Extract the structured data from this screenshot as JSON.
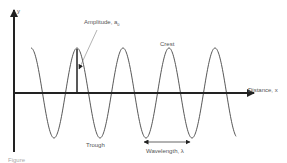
{
  "diagram": {
    "axes": {
      "y_label": "y",
      "x_label": "Distance, x"
    },
    "labels": {
      "amplitude": "Amplitude, a",
      "amplitude_subscript": "0",
      "crest": "Crest",
      "trough": "Trough",
      "wavelength": "Wavelength, λ"
    },
    "caption": "Figure",
    "colors": {
      "axis": "#222222",
      "wave": "#444444",
      "text": "#555555"
    }
  }
}
